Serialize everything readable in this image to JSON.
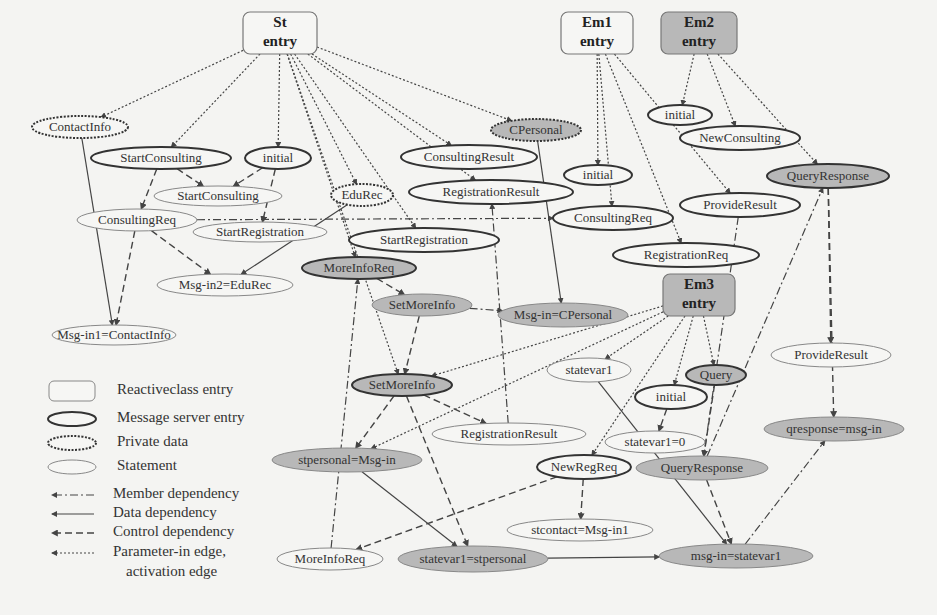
{
  "diagram": {
    "entries": [
      {
        "id": "st",
        "line1": "St",
        "line2": "entry",
        "kind": "reactiveclass",
        "fill": "#f6f6f4"
      },
      {
        "id": "em1",
        "line1": "Em1",
        "line2": "entry",
        "kind": "reactiveclass",
        "fill": "#f6f6f4"
      },
      {
        "id": "em2",
        "line1": "Em2",
        "line2": "entry",
        "kind": "reactiveclass",
        "fill": "#b8b8b8"
      },
      {
        "id": "em3",
        "line1": "Em3",
        "line2": "entry",
        "kind": "reactiveclass",
        "fill": "#b8b8b8"
      }
    ],
    "nodes": [
      {
        "id": "contactinfo",
        "label": "ContactInfo",
        "kind": "private",
        "shaded": false
      },
      {
        "id": "startconsulting_ms",
        "label": "StartConsulting",
        "kind": "message-server",
        "shaded": false
      },
      {
        "id": "st_initial",
        "label": "initial",
        "kind": "message-server",
        "shaded": false
      },
      {
        "id": "startconsulting_stmt",
        "label": "StartConsulting",
        "kind": "statement",
        "shaded": false
      },
      {
        "id": "consultingreq_st",
        "label": "ConsultingReq",
        "kind": "statement",
        "shaded": false
      },
      {
        "id": "startregistration_stmt",
        "label": "StartRegistration",
        "kind": "statement",
        "shaded": false
      },
      {
        "id": "edurec",
        "label": "EduRec",
        "kind": "private",
        "shaded": false
      },
      {
        "id": "msgin2",
        "label": "Msg-in2=EduRec",
        "kind": "statement",
        "shaded": false
      },
      {
        "id": "msgin1",
        "label": "Msg-in1=ContactInfo",
        "kind": "statement",
        "shaded": false
      },
      {
        "id": "cpersonal",
        "label": "CPersonal",
        "kind": "private",
        "shaded": true
      },
      {
        "id": "consultingresult",
        "label": "ConsultingResult",
        "kind": "message-server",
        "shaded": false
      },
      {
        "id": "registrationresult_ms",
        "label": "RegistrationResult",
        "kind": "message-server",
        "shaded": false
      },
      {
        "id": "startregistration_ms",
        "label": "StartRegistration",
        "kind": "message-server",
        "shaded": false
      },
      {
        "id": "moreinforeq_ms",
        "label": "MoreInfoReq",
        "kind": "message-server",
        "shaded": true
      },
      {
        "id": "setmoreinfo_stmt",
        "label": "SetMoreInfo",
        "kind": "statement",
        "shaded": true
      },
      {
        "id": "msgin_cpersonal",
        "label": "Msg-in=CPersonal",
        "kind": "statement",
        "shaded": true
      },
      {
        "id": "em1_initial",
        "label": "initial",
        "kind": "message-server",
        "shaded": false
      },
      {
        "id": "consultingreq_em1",
        "label": "ConsultingReq",
        "kind": "message-server",
        "shaded": false
      },
      {
        "id": "registrationreq",
        "label": "RegistrationReq",
        "kind": "message-server",
        "shaded": false
      },
      {
        "id": "em2_initial",
        "label": "initial",
        "kind": "message-server",
        "shaded": false
      },
      {
        "id": "newconsulting",
        "label": "NewConsulting",
        "kind": "message-server",
        "shaded": false
      },
      {
        "id": "queryresponse_ms",
        "label": "QueryResponse",
        "kind": "message-server",
        "shaded": true
      },
      {
        "id": "provideresult_ms",
        "label": "ProvideResult",
        "kind": "message-server",
        "shaded": false
      },
      {
        "id": "provideresult_stmt",
        "label": "ProvideResult",
        "kind": "statement",
        "shaded": false
      },
      {
        "id": "qresponse",
        "label": "qresponse=msg-in",
        "kind": "statement",
        "shaded": true
      },
      {
        "id": "setmoreinfo_ms",
        "label": "SetMoreInfo",
        "kind": "message-server",
        "shaded": true
      },
      {
        "id": "statevar1",
        "label": "statevar1",
        "kind": "statement",
        "shaded": false
      },
      {
        "id": "em3_initial",
        "label": "initial",
        "kind": "message-server",
        "shaded": false
      },
      {
        "id": "query",
        "label": "Query",
        "kind": "message-server",
        "shaded": true
      },
      {
        "id": "statevar1_0",
        "label": "statevar1=0",
        "kind": "statement",
        "shaded": false
      },
      {
        "id": "registrationresult_stmt",
        "label": "RegistrationResult",
        "kind": "statement",
        "shaded": false
      },
      {
        "id": "stpersonal",
        "label": "stpersonal=Msg-in",
        "kind": "statement",
        "shaded": true
      },
      {
        "id": "newregreq",
        "label": "NewRegReq",
        "kind": "message-server",
        "shaded": false
      },
      {
        "id": "queryresponse_stmt",
        "label": "QueryResponse",
        "kind": "statement",
        "shaded": true
      },
      {
        "id": "stcontact",
        "label": "stcontact=Msg-in1",
        "kind": "statement",
        "shaded": false
      },
      {
        "id": "moreinforeq_stmt",
        "label": "MoreInfoReq",
        "kind": "statement",
        "shaded": false
      },
      {
        "id": "statevar1_stpersonal",
        "label": "statevar1=stpersonal",
        "kind": "statement",
        "shaded": true
      },
      {
        "id": "msgin_statevar1",
        "label": "msg-in=statevar1",
        "kind": "statement",
        "shaded": true
      }
    ],
    "edges": [
      {
        "from": "st",
        "to": "contactinfo",
        "type": "param"
      },
      {
        "from": "st",
        "to": "startconsulting_ms",
        "type": "param"
      },
      {
        "from": "st",
        "to": "st_initial",
        "type": "param"
      },
      {
        "from": "st",
        "to": "edurec",
        "type": "param"
      },
      {
        "from": "st",
        "to": "cpersonal",
        "type": "param"
      },
      {
        "from": "st",
        "to": "consultingresult",
        "type": "param"
      },
      {
        "from": "st",
        "to": "registrationresult_ms",
        "type": "param"
      },
      {
        "from": "st",
        "to": "startregistration_ms",
        "type": "param"
      },
      {
        "from": "st",
        "to": "moreinforeq_ms",
        "type": "param"
      },
      {
        "from": "st",
        "to": "setmoreinfo_ms",
        "type": "param"
      },
      {
        "from": "em1",
        "to": "em1_initial",
        "type": "param"
      },
      {
        "from": "em1",
        "to": "consultingreq_em1",
        "type": "param"
      },
      {
        "from": "em1",
        "to": "registrationreq",
        "type": "param"
      },
      {
        "from": "em1",
        "to": "provideresult_ms",
        "type": "param"
      },
      {
        "from": "em2",
        "to": "em2_initial",
        "type": "param"
      },
      {
        "from": "em2",
        "to": "newconsulting",
        "type": "param"
      },
      {
        "from": "em2",
        "to": "queryresponse_ms",
        "type": "param"
      },
      {
        "from": "em3",
        "to": "statevar1",
        "type": "param"
      },
      {
        "from": "em3",
        "to": "em3_initial",
        "type": "param"
      },
      {
        "from": "em3",
        "to": "query",
        "type": "param"
      },
      {
        "from": "em3",
        "to": "newregreq",
        "type": "param"
      },
      {
        "from": "em3",
        "to": "setmoreinfo_ms",
        "type": "param"
      },
      {
        "from": "em3",
        "to": "stpersonal",
        "type": "param"
      },
      {
        "from": "startconsulting_ms",
        "to": "startconsulting_stmt",
        "type": "control"
      },
      {
        "from": "startconsulting_ms",
        "to": "consultingreq_st",
        "type": "control"
      },
      {
        "from": "st_initial",
        "to": "startconsulting_stmt",
        "type": "control"
      },
      {
        "from": "st_initial",
        "to": "startregistration_stmt",
        "type": "control"
      },
      {
        "from": "consultingreq_st",
        "to": "msgin2",
        "type": "control"
      },
      {
        "from": "consultingreq_st",
        "to": "msgin1",
        "type": "control"
      },
      {
        "from": "consultingreq_st",
        "to": "consultingreq_em1",
        "type": "member"
      },
      {
        "from": "contactinfo",
        "to": "msgin1",
        "type": "data"
      },
      {
        "from": "edurec",
        "to": "msgin2",
        "type": "data"
      },
      {
        "from": "cpersonal",
        "to": "msgin_cpersonal",
        "type": "data"
      },
      {
        "from": "moreinforeq_ms",
        "to": "setmoreinfo_stmt",
        "type": "control"
      },
      {
        "from": "setmoreinfo_stmt",
        "to": "msgin_cpersonal",
        "type": "member"
      },
      {
        "from": "setmoreinfo_stmt",
        "to": "setmoreinfo_ms",
        "type": "control"
      },
      {
        "from": "registrationresult_stmt",
        "to": "registrationresult_ms",
        "type": "member"
      },
      {
        "from": "setmoreinfo_ms",
        "to": "registrationresult_stmt",
        "type": "control"
      },
      {
        "from": "setmoreinfo_ms",
        "to": "stpersonal",
        "type": "control"
      },
      {
        "from": "setmoreinfo_ms",
        "to": "statevar1_stpersonal",
        "type": "control"
      },
      {
        "from": "moreinforeq_stmt",
        "to": "moreinforeq_ms",
        "type": "member"
      },
      {
        "from": "stpersonal",
        "to": "statevar1_stpersonal",
        "type": "data"
      },
      {
        "from": "newregreq",
        "to": "stcontact",
        "type": "control"
      },
      {
        "from": "newregreq",
        "to": "moreinforeq_stmt",
        "type": "control"
      },
      {
        "from": "statevar1",
        "to": "msgin_statevar1",
        "type": "data"
      },
      {
        "from": "em3_initial",
        "to": "statevar1_0",
        "type": "control"
      },
      {
        "from": "query",
        "to": "queryresponse_stmt",
        "type": "control"
      },
      {
        "from": "queryresponse_stmt",
        "to": "msgin_statevar1",
        "type": "control"
      },
      {
        "from": "statevar1_stpersonal",
        "to": "msgin_statevar1",
        "type": "data"
      },
      {
        "from": "msgin_statevar1",
        "to": "qresponse",
        "type": "member"
      },
      {
        "from": "queryresponse_stmt",
        "to": "queryresponse_ms",
        "type": "member"
      },
      {
        "from": "queryresponse_ms",
        "to": "qresponse",
        "type": "control"
      },
      {
        "from": "queryresponse_ms",
        "to": "provideresult_stmt",
        "type": "control"
      },
      {
        "from": "provideresult_ms",
        "to": "queryresponse_stmt",
        "type": "member"
      }
    ],
    "legend": {
      "node_items": [
        {
          "kind": "reactiveclass",
          "label": "Reactiveclass entry"
        },
        {
          "kind": "message-server",
          "label": "Message server entry"
        },
        {
          "kind": "private",
          "label": "Private data"
        },
        {
          "kind": "statement",
          "label": "Statement"
        }
      ],
      "edge_items": [
        {
          "type": "member",
          "label": "Member dependency"
        },
        {
          "type": "data",
          "label": "Data dependency"
        },
        {
          "type": "control",
          "label": "Control dependency"
        },
        {
          "type": "param",
          "label": "Parameter-in edge,",
          "label2": "activation edge"
        }
      ]
    },
    "colors": {
      "background": "#f4f4f2",
      "shaded_fill": "#b8b8b8",
      "plain_fill": "#f6f6f4",
      "stroke": "#444444",
      "statement_stroke": "#888888"
    }
  }
}
